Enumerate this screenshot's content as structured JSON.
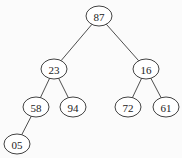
{
  "diagram": {
    "type": "binary-tree",
    "colors": {
      "background": "#fbfbfb",
      "stroke": "#2e2e2e",
      "text": "#222222",
      "node_fill": "#ffffff"
    },
    "nodes": [
      {
        "id": "n87",
        "label": "87",
        "cx": 99,
        "cy": 16
      },
      {
        "id": "n23",
        "label": "23",
        "cx": 54,
        "cy": 69
      },
      {
        "id": "n16",
        "label": "16",
        "cx": 146,
        "cy": 69
      },
      {
        "id": "n58",
        "label": "58",
        "cx": 36,
        "cy": 107
      },
      {
        "id": "n94",
        "label": "94",
        "cx": 73,
        "cy": 107
      },
      {
        "id": "n72",
        "label": "72",
        "cx": 128,
        "cy": 107
      },
      {
        "id": "n61",
        "label": "61",
        "cx": 166,
        "cy": 107
      },
      {
        "id": "n05",
        "label": "05",
        "cx": 17,
        "cy": 144
      }
    ],
    "edges": [
      {
        "from": "n87",
        "to": "n23"
      },
      {
        "from": "n87",
        "to": "n16"
      },
      {
        "from": "n23",
        "to": "n58"
      },
      {
        "from": "n23",
        "to": "n94"
      },
      {
        "from": "n16",
        "to": "n72"
      },
      {
        "from": "n16",
        "to": "n61"
      },
      {
        "from": "n58",
        "to": "n05"
      }
    ],
    "node_rx": 13,
    "node_ry": 10
  }
}
